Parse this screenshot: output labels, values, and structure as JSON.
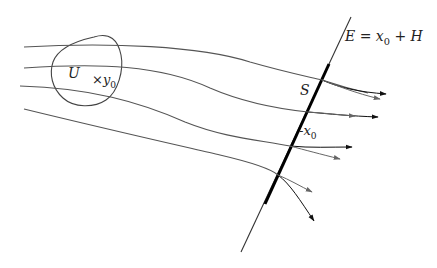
{
  "diagram": {
    "labels": {
      "region": "U",
      "point_marker": "×",
      "point_base": "y",
      "point_sub": "0",
      "section": "S",
      "x0_tick": "-",
      "x0_base": "x",
      "x0_sub": "0",
      "plane_lhs": "E = x",
      "plane_sub": "0",
      "plane_rhs": " + H"
    },
    "colors": {
      "flow_line": "#555555",
      "region_outline": "#444444",
      "plane_line": "#333333",
      "section_line": "#000000",
      "arrow_dark": "#111111",
      "arrow_gray": "#666666"
    }
  }
}
